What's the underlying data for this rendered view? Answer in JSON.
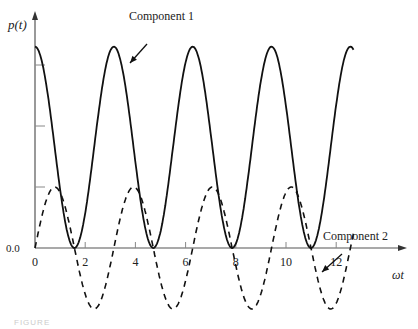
{
  "chart_data": {
    "type": "line",
    "title": "",
    "xlabel": "ωt",
    "ylabel": "p(t)",
    "xlim": [
      0,
      13.5
    ],
    "ylim": [
      -1.0,
      3.3
    ],
    "x_ticks": [
      0,
      2,
      4,
      6,
      8,
      10,
      12
    ],
    "x_tick_labels": [
      "0",
      "2",
      "4",
      "6",
      "8",
      "10",
      "12"
    ],
    "y_ticks": [
      0,
      1,
      2,
      3
    ],
    "y_tick_labels": [
      "0.0",
      "",
      "",
      ""
    ],
    "grid": false,
    "legend": "annotations",
    "series": [
      {
        "name": "Component 1",
        "style": "solid",
        "formula": "3.3*cos^2(ωt)",
        "x_range": [
          0,
          12.7
        ],
        "peaks_x": [
          0,
          3.14,
          6.28,
          9.42,
          12.57
        ],
        "peak_value": 3.3,
        "minima_x": [
          1.57,
          4.71,
          7.85,
          11.0
        ],
        "min_value": 0.0
      },
      {
        "name": "Component 2",
        "style": "dashed",
        "formula": "1.0*sin(2ωt)",
        "x_range": [
          0,
          12.7
        ],
        "peaks_x": [
          0.79,
          3.93,
          7.07,
          10.21
        ],
        "peak_value": 1.0,
        "troughs_x": [
          2.36,
          5.5,
          8.64,
          11.78
        ],
        "trough_value": -1.0
      }
    ],
    "annotations": [
      {
        "text": "Component 1",
        "target_series": "Component 1",
        "text_pos": [
          136,
          16
        ],
        "arrow_from": [
          147,
          44
        ],
        "arrow_to": [
          130,
          63
        ]
      },
      {
        "text": "Component 2",
        "target_series": "Component 2",
        "text_pos": [
          324,
          237
        ],
        "arrow_from": [
          342,
          254
        ],
        "arrow_to": [
          322,
          272
        ]
      }
    ]
  },
  "labels": {
    "y_axis": "p(t)",
    "x_axis": "ωt",
    "origin_y": "0.0",
    "comp1": "Component 1",
    "comp2": "Component 2",
    "caption": "FIGURE"
  }
}
